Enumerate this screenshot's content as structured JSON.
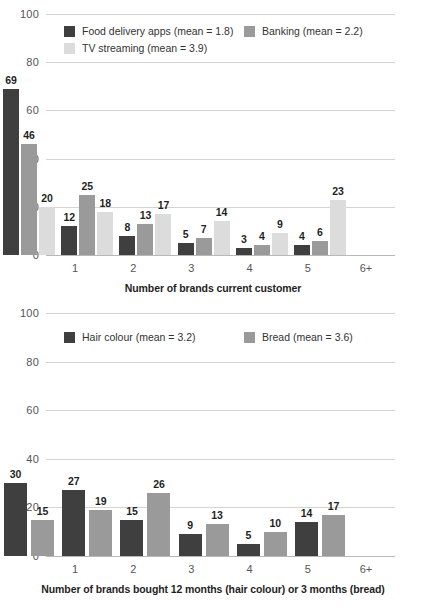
{
  "colors": {
    "dark": "#3f3f3f",
    "medium": "#9a9a9a",
    "light": "#dcdcdc",
    "gridline": "#d4d4d4",
    "baseline": "#b8b8b8",
    "axis_text": "#555555",
    "label_text": "#1f1f1f"
  },
  "chart_data": [
    {
      "type": "bar",
      "id": "chart-top",
      "title": "",
      "xlabel": "Number of brands current customer",
      "ylabel": "",
      "ylim": [
        0,
        100
      ],
      "yticks": [
        0,
        20,
        40,
        60,
        80,
        100
      ],
      "ytick_labels": [
        "0",
        "20",
        "40",
        "60",
        "80",
        "100"
      ],
      "grid": true,
      "legend_position": "top-inside",
      "categories": [
        "1",
        "2",
        "3",
        "4",
        "5",
        "6+"
      ],
      "series": [
        {
          "name": "Food delivery apps (mean = 1.8)",
          "color": "#3f3f3f",
          "values": [
            69,
            12,
            8,
            5,
            3,
            4
          ]
        },
        {
          "name": "Banking (mean = 2.2)",
          "color": "#9a9a9a",
          "values": [
            46,
            25,
            13,
            7,
            4,
            6
          ]
        },
        {
          "name": "TV streaming (mean = 3.9)",
          "color": "#dcdcdc",
          "values": [
            20,
            18,
            17,
            14,
            9,
            23
          ]
        }
      ]
    },
    {
      "type": "bar",
      "id": "chart-bottom",
      "title": "",
      "xlabel": "Number of brands bought 12 months (hair colour) or 3 months (bread)",
      "ylabel": "",
      "ylim": [
        0,
        100
      ],
      "yticks": [
        0,
        20,
        40,
        60,
        80,
        100
      ],
      "ytick_labels": [
        "0",
        "20",
        "40",
        "60",
        "80",
        "100"
      ],
      "grid": true,
      "legend_position": "top-inside",
      "categories": [
        "1",
        "2",
        "3",
        "4",
        "5",
        "6+"
      ],
      "series": [
        {
          "name": "Hair colour (mean = 3.2)",
          "color": "#3f3f3f",
          "values": [
            30,
            27,
            15,
            9,
            5,
            14
          ]
        },
        {
          "name": "Bread (mean = 3.6)",
          "color": "#9a9a9a",
          "values": [
            15,
            19,
            26,
            13,
            10,
            17
          ]
        }
      ]
    }
  ]
}
